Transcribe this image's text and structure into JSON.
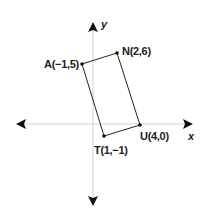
{
  "diagram": {
    "type": "coordinate-plane-quadrilateral",
    "axes": {
      "x_label": "x",
      "y_label": "y",
      "axis_color": "#cccccc",
      "arrow_color": "#111111"
    },
    "shape": {
      "name": "ANUT",
      "stroke_color": "#222222",
      "vertices": [
        {
          "name": "A",
          "label": "A(−1,5)",
          "x": -1,
          "y": 5
        },
        {
          "name": "N",
          "label": "N(2,6)",
          "x": 2,
          "y": 6
        },
        {
          "name": "U",
          "label": "U(4,0)",
          "x": 4,
          "y": 0
        },
        {
          "name": "T",
          "label": "T(1,−1)",
          "x": 1,
          "y": -1
        }
      ]
    }
  }
}
